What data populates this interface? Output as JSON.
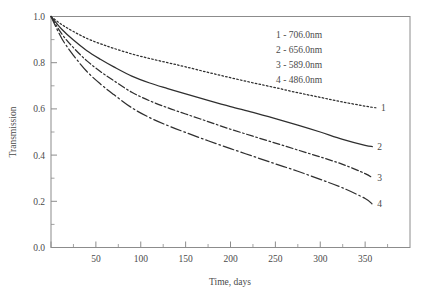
{
  "chart_data": {
    "type": "line",
    "title": "",
    "xlabel": "Time, days",
    "ylabel": "Transmission",
    "xlim": [
      0,
      400
    ],
    "ylim": [
      0.0,
      1.0
    ],
    "grid": false,
    "legend_position": "top-right-inside",
    "x_ticks": [
      0,
      50,
      100,
      150,
      200,
      250,
      300,
      350
    ],
    "x_tick_labels": [
      "",
      "50",
      "100",
      "150",
      "200",
      "250",
      "300",
      "350"
    ],
    "x_minor_ticks": [
      25,
      75,
      125,
      175,
      225,
      275,
      325,
      375
    ],
    "y_ticks": [
      0.0,
      0.2,
      0.4,
      0.6,
      0.8,
      1.0
    ],
    "y_tick_labels": [
      "0.0",
      "0.2",
      "0.4",
      "0.6",
      "0.8",
      "1.0"
    ],
    "y_minor_ticks": [
      0.1,
      0.3,
      0.5,
      0.7,
      0.9
    ],
    "legend_entries": [
      "1 - 706.0nm",
      "2 - 656.0nm",
      "3 - 589.0nm",
      "4 - 486.0nm"
    ],
    "series": [
      {
        "name": "1 - 706.0nm",
        "label": "1",
        "wavelength_nm": 706.0,
        "style": "dotted",
        "color": "#2f2f2f",
        "x": [
          0,
          12,
          25,
          40,
          55,
          70,
          90,
          110,
          130,
          150,
          175,
          200,
          225,
          250,
          275,
          300,
          325,
          350,
          362
        ],
        "values": [
          1.0,
          0.965,
          0.935,
          0.905,
          0.882,
          0.862,
          0.838,
          0.818,
          0.8,
          0.782,
          0.758,
          0.735,
          0.713,
          0.692,
          0.67,
          0.65,
          0.63,
          0.612,
          0.605
        ]
      },
      {
        "name": "2 - 656.0nm",
        "label": "2",
        "wavelength_nm": 656.0,
        "style": "solid",
        "color": "#2f2f2f",
        "x": [
          0,
          12,
          25,
          40,
          55,
          70,
          90,
          110,
          130,
          150,
          175,
          200,
          225,
          250,
          275,
          300,
          325,
          350,
          358
        ],
        "values": [
          1.0,
          0.945,
          0.898,
          0.852,
          0.815,
          0.782,
          0.742,
          0.712,
          0.688,
          0.665,
          0.637,
          0.61,
          0.585,
          0.558,
          0.53,
          0.5,
          0.468,
          0.442,
          0.437
        ]
      },
      {
        "name": "3 - 589.0nm",
        "label": "3",
        "wavelength_nm": 589.0,
        "style": "dashdot",
        "color": "#2f2f2f",
        "x": [
          0,
          12,
          25,
          40,
          55,
          70,
          90,
          110,
          130,
          150,
          175,
          200,
          225,
          250,
          275,
          300,
          325,
          350,
          358
        ],
        "values": [
          1.0,
          0.925,
          0.865,
          0.808,
          0.762,
          0.722,
          0.672,
          0.635,
          0.605,
          0.578,
          0.545,
          0.512,
          0.482,
          0.452,
          0.422,
          0.392,
          0.36,
          0.32,
          0.302
        ]
      },
      {
        "name": "4 - 486.0nm",
        "label": "4",
        "wavelength_nm": 486.0,
        "style": "longdashdot",
        "color": "#2f2f2f",
        "x": [
          0,
          12,
          25,
          40,
          55,
          70,
          90,
          110,
          130,
          150,
          175,
          200,
          225,
          250,
          275,
          300,
          325,
          350,
          358
        ],
        "values": [
          1.0,
          0.905,
          0.832,
          0.762,
          0.708,
          0.662,
          0.605,
          0.562,
          0.528,
          0.498,
          0.462,
          0.428,
          0.395,
          0.362,
          0.33,
          0.295,
          0.258,
          0.212,
          0.188
        ]
      }
    ]
  }
}
